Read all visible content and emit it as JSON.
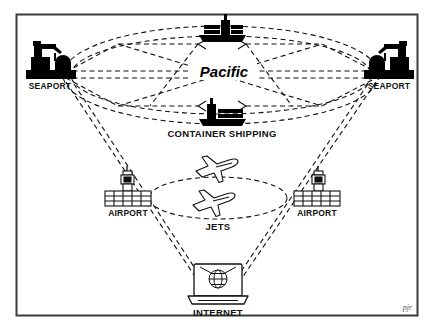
{
  "figure": {
    "signature": "pjr",
    "border_color": "#3a3a3a",
    "background": "#ffffff",
    "ink_color": "#000000"
  },
  "labels": {
    "pacific": "Pacific",
    "seaport_left": "SEAPORT",
    "seaport_right": "SEAPORT",
    "container_shipping": "CONTAINER SHIPPING",
    "airport_left": "AIRPORT",
    "airport_right": "AIRPORT",
    "jets": "JETS",
    "internet": "INTERNET"
  },
  "nodes": [
    {
      "id": "seaport-left",
      "label": "SEAPORT",
      "icon": "port-crane-icon",
      "x": 48,
      "y": 62
    },
    {
      "id": "seaport-right",
      "label": "SEAPORT",
      "icon": "port-crane-icon",
      "x": 386,
      "y": 62
    },
    {
      "id": "ship-top",
      "label": "",
      "icon": "container-ship-icon",
      "x": 222,
      "y": 28
    },
    {
      "id": "ship-bottom",
      "label": "CONTAINER SHIPPING",
      "icon": "container-ship-icon",
      "x": 222,
      "y": 112
    },
    {
      "id": "airport-left",
      "label": "AIRPORT",
      "icon": "control-tower-icon",
      "x": 127,
      "y": 190
    },
    {
      "id": "airport-right",
      "label": "AIRPORT",
      "icon": "control-tower-icon",
      "x": 316,
      "y": 190
    },
    {
      "id": "jet-upper",
      "label": "",
      "icon": "airplane-icon",
      "x": 217,
      "y": 167
    },
    {
      "id": "jet-lower",
      "label": "JETS",
      "icon": "airplane-icon",
      "x": 214,
      "y": 201
    },
    {
      "id": "internet",
      "label": "INTERNET",
      "icon": "laptop-globe-icon",
      "x": 218,
      "y": 288
    }
  ],
  "clouds": [
    {
      "id": "pacific-cloud",
      "label": "Pacific",
      "style": "dashed-ellipse",
      "cx": 220,
      "cy": 75,
      "rx": 158,
      "ry": 48
    },
    {
      "id": "jets-cloud",
      "label": "JETS",
      "style": "dashed-ellipse",
      "cx": 218,
      "cy": 198,
      "rx": 68,
      "ry": 21
    }
  ],
  "connections": {
    "style": "dashed",
    "mesh": "pacific-mesh",
    "cone": "seaports-to-internet-cone"
  }
}
